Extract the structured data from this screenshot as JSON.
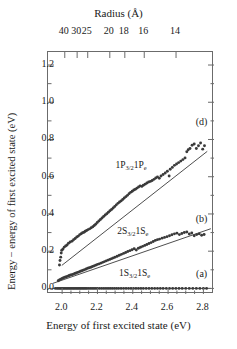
{
  "figure": {
    "top_axis_title": "Radius (Å)",
    "x_axis_title": "Energy of first excited state (eV)",
    "y_axis_title": "Energy − energy of first excited state (eV)"
  },
  "chart_data": {
    "type": "scatter",
    "title": "",
    "xlabel": "Energy of first excited state (eV)",
    "ylabel": "Energy − energy of first excited state (eV)",
    "xlim": [
      1.92,
      2.86
    ],
    "ylim": [
      -0.03,
      1.27
    ],
    "xticks": [
      2.0,
      2.2,
      2.4,
      2.6,
      2.8
    ],
    "xtick_labels": [
      "2.0",
      "2.2",
      "2.4",
      "2.6",
      "2.8"
    ],
    "xminor_step": 0.05,
    "yticks": [
      0.0,
      0.2,
      0.4,
      0.6,
      0.8,
      1.0,
      1.2
    ],
    "ytick_labels": [
      "0.0",
      "0.2",
      "0.4",
      "0.6",
      "0.8",
      "1.0",
      "1.2"
    ],
    "yminor_step": 0.1,
    "grid": false,
    "legend": "none",
    "secondary_axis": {
      "position": "top",
      "label": "Radius (Å)",
      "ticks": [
        40,
        30,
        25,
        20,
        18,
        16,
        14
      ],
      "tick_labels": [
        "40",
        "30",
        "25",
        "20",
        "18",
        "16",
        "14"
      ],
      "tick_x_energy": [
        2.015,
        2.085,
        2.145,
        2.27,
        2.355,
        2.465,
        2.645
      ]
    },
    "annotations": [
      {
        "text": "(d)",
        "x": 2.79,
        "y": 0.895
      },
      {
        "text": "(b)",
        "x": 2.79,
        "y": 0.375
      },
      {
        "text": "(a)",
        "x": 2.79,
        "y": 0.075
      }
    ],
    "series": [
      {
        "name": "1P3/2 1Pe",
        "label": "1P<sub>3/2</sub>1P<sub>e</sub>",
        "panel": "(d)",
        "label_x": 2.39,
        "label_y": 0.655,
        "color": "#3a3a3a",
        "marker": "circle",
        "fit": {
          "type": "linear",
          "x0": 2.0,
          "y0": 0.125,
          "x1": 2.82,
          "y1": 0.735
        },
        "points": [
          [
            1.985,
            0.126
          ],
          [
            1.988,
            0.15
          ],
          [
            1.992,
            0.168
          ],
          [
            1.995,
            0.19
          ],
          [
            1.998,
            0.205
          ],
          [
            2.005,
            0.212
          ],
          [
            2.012,
            0.222
          ],
          [
            2.02,
            0.228
          ],
          [
            2.028,
            0.233
          ],
          [
            2.036,
            0.243
          ],
          [
            2.046,
            0.249
          ],
          [
            2.056,
            0.254
          ],
          [
            2.065,
            0.262
          ],
          [
            2.074,
            0.268
          ],
          [
            2.083,
            0.276
          ],
          [
            2.092,
            0.281
          ],
          [
            2.1,
            0.289
          ],
          [
            2.108,
            0.294
          ],
          [
            2.116,
            0.299
          ],
          [
            2.124,
            0.302
          ],
          [
            2.131,
            0.307
          ],
          [
            2.139,
            0.311
          ],
          [
            2.147,
            0.316
          ],
          [
            2.156,
            0.32
          ],
          [
            2.165,
            0.326
          ],
          [
            2.174,
            0.331
          ],
          [
            2.182,
            0.338
          ],
          [
            2.19,
            0.345
          ],
          [
            2.199,
            0.354
          ],
          [
            2.208,
            0.362
          ],
          [
            2.217,
            0.37
          ],
          [
            2.226,
            0.378
          ],
          [
            2.235,
            0.386
          ],
          [
            2.244,
            0.394
          ],
          [
            2.253,
            0.401
          ],
          [
            2.262,
            0.409
          ],
          [
            2.271,
            0.417
          ],
          [
            2.28,
            0.424
          ],
          [
            2.289,
            0.432
          ],
          [
            2.298,
            0.44
          ],
          [
            2.307,
            0.449
          ],
          [
            2.316,
            0.457
          ],
          [
            2.325,
            0.464
          ],
          [
            2.334,
            0.47
          ],
          [
            2.343,
            0.478
          ],
          [
            2.352,
            0.486
          ],
          [
            2.361,
            0.493
          ],
          [
            2.37,
            0.5
          ],
          [
            2.379,
            0.509
          ],
          [
            2.388,
            0.516
          ],
          [
            2.397,
            0.522
          ],
          [
            2.406,
            0.529
          ],
          [
            2.415,
            0.533
          ],
          [
            2.424,
            0.539
          ],
          [
            2.433,
            0.545
          ],
          [
            2.442,
            0.551
          ],
          [
            2.451,
            0.548
          ],
          [
            2.46,
            0.554
          ],
          [
            2.47,
            0.56
          ],
          [
            2.48,
            0.566
          ],
          [
            2.49,
            0.572
          ],
          [
            2.5,
            0.575
          ],
          [
            2.51,
            0.58
          ],
          [
            2.52,
            0.586
          ],
          [
            2.53,
            0.593
          ],
          [
            2.54,
            0.599
          ],
          [
            2.55,
            0.592
          ],
          [
            2.56,
            0.604
          ],
          [
            2.572,
            0.612
          ],
          [
            2.584,
            0.62
          ],
          [
            2.596,
            0.629
          ],
          [
            2.606,
            0.604
          ],
          [
            2.612,
            0.64
          ],
          [
            2.624,
            0.65
          ],
          [
            2.636,
            0.661
          ],
          [
            2.648,
            0.668
          ],
          [
            2.66,
            0.676
          ],
          [
            2.672,
            0.684
          ],
          [
            2.684,
            0.692
          ],
          [
            2.696,
            0.701
          ],
          [
            2.706,
            0.734
          ],
          [
            2.714,
            0.745
          ],
          [
            2.724,
            0.752
          ],
          [
            2.736,
            0.769
          ],
          [
            2.748,
            0.776
          ],
          [
            2.76,
            0.752
          ],
          [
            2.772,
            0.766
          ],
          [
            2.784,
            0.781
          ],
          [
            2.796,
            0.748
          ],
          [
            2.806,
            0.766
          ]
        ]
      },
      {
        "name": "2S3/2 1Se",
        "label": "2S<sub>3/2</sub>1S<sub>e</sub>",
        "panel": "(b)",
        "label_x": 2.4,
        "label_y": 0.305,
        "color": "#3a3a3a",
        "marker": "circle",
        "fit": {
          "type": "linear",
          "x0": 1.95,
          "y0": 0.028,
          "x1": 2.84,
          "y1": 0.32
        },
        "points": [
          [
            1.978,
            0.041
          ],
          [
            1.985,
            0.046
          ],
          [
            1.992,
            0.05
          ],
          [
            2.0,
            0.053
          ],
          [
            2.008,
            0.057
          ],
          [
            2.016,
            0.06
          ],
          [
            2.024,
            0.063
          ],
          [
            2.032,
            0.066
          ],
          [
            2.04,
            0.069
          ],
          [
            2.048,
            0.072
          ],
          [
            2.056,
            0.074
          ],
          [
            2.064,
            0.077
          ],
          [
            2.072,
            0.08
          ],
          [
            2.08,
            0.083
          ],
          [
            2.088,
            0.086
          ],
          [
            2.096,
            0.089
          ],
          [
            2.104,
            0.092
          ],
          [
            2.112,
            0.095
          ],
          [
            2.12,
            0.098
          ],
          [
            2.128,
            0.101
          ],
          [
            2.136,
            0.104
          ],
          [
            2.145,
            0.108
          ],
          [
            2.154,
            0.111
          ],
          [
            2.163,
            0.114
          ],
          [
            2.172,
            0.118
          ],
          [
            2.181,
            0.121
          ],
          [
            2.19,
            0.125
          ],
          [
            2.2,
            0.129
          ],
          [
            2.21,
            0.132
          ],
          [
            2.22,
            0.136
          ],
          [
            2.23,
            0.14
          ],
          [
            2.24,
            0.144
          ],
          [
            2.25,
            0.148
          ],
          [
            2.26,
            0.152
          ],
          [
            2.27,
            0.156
          ],
          [
            2.28,
            0.16
          ],
          [
            2.29,
            0.164
          ],
          [
            2.3,
            0.168
          ],
          [
            2.312,
            0.173
          ],
          [
            2.324,
            0.178
          ],
          [
            2.336,
            0.183
          ],
          [
            2.348,
            0.188
          ],
          [
            2.36,
            0.193
          ],
          [
            2.372,
            0.198
          ],
          [
            2.384,
            0.203
          ],
          [
            2.396,
            0.208
          ],
          [
            2.408,
            0.213
          ],
          [
            2.42,
            0.206
          ],
          [
            2.432,
            0.216
          ],
          [
            2.444,
            0.221
          ],
          [
            2.456,
            0.226
          ],
          [
            2.468,
            0.231
          ],
          [
            2.48,
            0.236
          ],
          [
            2.492,
            0.241
          ],
          [
            2.504,
            0.246
          ],
          [
            2.516,
            0.252
          ],
          [
            2.528,
            0.258
          ],
          [
            2.54,
            0.262
          ],
          [
            2.552,
            0.265
          ],
          [
            2.566,
            0.27
          ],
          [
            2.58,
            0.274
          ],
          [
            2.594,
            0.278
          ],
          [
            2.608,
            0.283
          ],
          [
            2.622,
            0.288
          ],
          [
            2.636,
            0.293
          ],
          [
            2.65,
            0.297
          ],
          [
            2.664,
            0.289
          ],
          [
            2.678,
            0.295
          ],
          [
            2.692,
            0.3
          ],
          [
            2.706,
            0.303
          ],
          [
            2.72,
            0.292
          ],
          [
            2.734,
            0.298
          ],
          [
            2.748,
            0.283
          ],
          [
            2.762,
            0.289
          ],
          [
            2.776,
            0.293
          ],
          [
            2.79,
            0.286
          ],
          [
            2.804,
            0.29
          ]
        ]
      },
      {
        "name": "1S3/2 1Se",
        "label": "1S<sub>3/2</sub>1S<sub>e</sub>",
        "panel": "(a)",
        "label_x": 2.41,
        "label_y": 0.075,
        "color": "#3a3a3a",
        "marker": "circle",
        "fit": {
          "type": "linear",
          "x0": 1.95,
          "y0": 0.0,
          "x1": 2.84,
          "y1": 0.0
        },
        "points": [
          [
            1.962,
            0.0
          ],
          [
            1.972,
            0.0
          ],
          [
            1.98,
            0.0
          ],
          [
            1.988,
            0.0
          ],
          [
            1.996,
            0.0
          ],
          [
            2.004,
            0.0
          ],
          [
            2.012,
            0.0
          ],
          [
            2.02,
            0.0
          ],
          [
            2.028,
            0.0
          ],
          [
            2.036,
            0.0
          ],
          [
            2.044,
            0.0
          ],
          [
            2.052,
            0.0
          ],
          [
            2.06,
            0.0
          ],
          [
            2.068,
            0.0
          ],
          [
            2.076,
            0.0
          ],
          [
            2.084,
            0.0
          ],
          [
            2.092,
            0.0
          ],
          [
            2.1,
            0.0
          ],
          [
            2.108,
            0.0
          ],
          [
            2.116,
            0.0
          ],
          [
            2.124,
            0.0
          ],
          [
            2.132,
            0.0
          ],
          [
            2.14,
            0.0
          ],
          [
            2.15,
            0.0
          ],
          [
            2.16,
            0.0
          ],
          [
            2.17,
            0.0
          ],
          [
            2.18,
            0.0
          ],
          [
            2.19,
            0.0
          ],
          [
            2.2,
            0.0
          ],
          [
            2.212,
            0.0
          ],
          [
            2.224,
            0.0
          ],
          [
            2.236,
            0.0
          ],
          [
            2.248,
            0.0
          ],
          [
            2.26,
            0.0
          ],
          [
            2.272,
            0.0
          ],
          [
            2.284,
            0.0
          ],
          [
            2.296,
            0.0
          ],
          [
            2.308,
            0.0
          ],
          [
            2.32,
            0.0
          ],
          [
            2.334,
            0.0
          ],
          [
            2.348,
            0.0
          ],
          [
            2.362,
            0.0
          ],
          [
            2.376,
            0.0
          ],
          [
            2.39,
            0.0
          ],
          [
            2.404,
            0.0
          ],
          [
            2.418,
            0.0
          ],
          [
            2.432,
            0.0
          ],
          [
            2.446,
            0.0
          ],
          [
            2.46,
            0.0
          ],
          [
            2.476,
            0.0
          ],
          [
            2.492,
            0.0
          ],
          [
            2.508,
            0.0
          ],
          [
            2.524,
            0.0
          ],
          [
            2.54,
            0.0
          ],
          [
            2.556,
            0.0
          ],
          [
            2.572,
            0.0
          ],
          [
            2.59,
            0.0
          ],
          [
            2.608,
            0.0
          ],
          [
            2.626,
            0.0
          ],
          [
            2.644,
            0.0
          ],
          [
            2.662,
            0.0
          ],
          [
            2.68,
            0.0
          ],
          [
            2.7,
            0.0
          ],
          [
            2.72,
            0.0
          ],
          [
            2.74,
            0.0
          ],
          [
            2.76,
            0.0
          ],
          [
            2.78,
            0.0
          ],
          [
            2.8,
            0.0
          ],
          [
            2.818,
            0.0
          ]
        ]
      }
    ]
  }
}
